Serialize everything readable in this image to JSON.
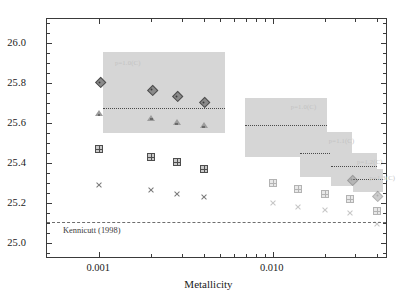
{
  "chart_data": {
    "type": "scatter",
    "title": "",
    "xlabel": "Metallicity",
    "ylabel": "log (ξ_ion,0 / erg⁻¹ Hz)",
    "xscale": "log",
    "xlim": [
      0.0005,
      0.045
    ],
    "ylim": [
      24.93,
      26.12
    ],
    "grid": false,
    "legend": null,
    "xticklabels": [
      "0.001",
      "0.010"
    ],
    "xtickvalues": [
      0.001,
      0.01
    ],
    "yticklabels": [
      "25.0",
      "25.2",
      "25.4",
      "25.6",
      "25.8",
      "26.0"
    ],
    "ytickvalues": [
      25.0,
      25.2,
      25.4,
      25.6,
      25.8,
      26.0
    ],
    "reference_line": {
      "label": "Kennicutt (1998)",
      "value": 25.105,
      "style": "dashed"
    },
    "series": [
      {
        "name": "diamond",
        "marker": "diamond",
        "x": [
          0.001,
          0.002,
          0.0028,
          0.004
        ],
        "y": [
          25.805,
          25.768,
          25.735,
          25.705
        ]
      },
      {
        "name": "triangle",
        "marker": "triangle",
        "x": [
          0.001,
          0.002,
          0.0028,
          0.004
        ],
        "y": [
          25.648,
          25.625,
          25.603,
          25.588
        ]
      },
      {
        "name": "square-cross",
        "marker": "square-cross",
        "x": [
          0.001,
          0.002,
          0.0028,
          0.004,
          0.01,
          0.014,
          0.02,
          0.028,
          0.04
        ],
        "y": [
          25.47,
          25.432,
          25.403,
          25.368,
          25.3,
          25.272,
          25.243,
          25.222,
          25.162
        ]
      },
      {
        "name": "x-small",
        "marker": "x",
        "x": [
          0.001,
          0.002,
          0.0028,
          0.004,
          0.01,
          0.014,
          0.02,
          0.028,
          0.04
        ],
        "y": [
          25.288,
          25.265,
          25.243,
          25.228,
          25.2,
          25.182,
          25.163,
          25.148,
          25.095
        ]
      },
      {
        "name": "diamond-right",
        "marker": "diamond",
        "x": [
          0.0285,
          0.04
        ],
        "y": [
          25.318,
          25.238
        ]
      }
    ],
    "bands": [
      {
        "label": "p=1.0(C)",
        "xmin": 0.00105,
        "xmax": 0.0053,
        "ymin": 25.548,
        "ymax": 25.955,
        "center": 25.677
      },
      {
        "label": "p=1.0(C)",
        "xmin": 0.0069,
        "xmax": 0.0205,
        "ymin": 25.432,
        "ymax": 25.723,
        "center": 25.592
      },
      {
        "label": "p=1.1(C)",
        "xmin": 0.0143,
        "xmax": 0.0285,
        "ymin": 25.332,
        "ymax": 25.553,
        "center": 25.452
      },
      {
        "label": "p=1.2(C)",
        "xmin": 0.0218,
        "xmax": 0.04,
        "ymin": 25.283,
        "ymax": 25.452,
        "center": 25.383
      },
      {
        "label": "p=1.3(C)",
        "xmin": 0.029,
        "xmax": 0.043,
        "ymin": 25.255,
        "ymax": 25.372,
        "center": 25.322
      }
    ]
  }
}
